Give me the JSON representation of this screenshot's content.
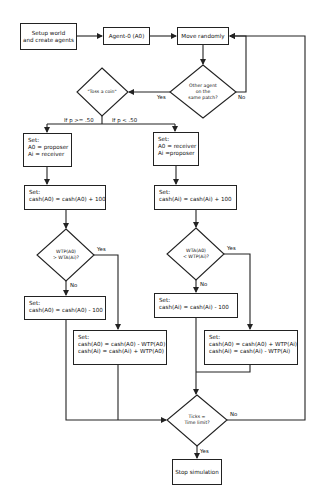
{
  "flowchart": {
    "nodes": {
      "setup": {
        "type": "process",
        "lines": [
          "Setup world",
          "and create agents"
        ]
      },
      "agent0": {
        "type": "process",
        "label": "Agent-0 (A0)"
      },
      "move": {
        "type": "process",
        "label": "Move randomly"
      },
      "other_agent": {
        "type": "decision",
        "lines": [
          "Other agent",
          "on the",
          "same patch?"
        ]
      },
      "toss": {
        "type": "decision",
        "label": "\"Toss a coin\""
      },
      "left_set_roles": {
        "type": "process",
        "lines": [
          "Set:",
          "A0 = proposer",
          "Ai = receiver"
        ]
      },
      "right_set_roles": {
        "type": "process",
        "lines": [
          "Set:",
          "A0 = receiver",
          "Ai =proposer"
        ]
      },
      "left_cash_plus": {
        "type": "process",
        "lines": [
          "Set:",
          "cash(A0) = cash(A0) + 100"
        ]
      },
      "right_cash_plus": {
        "type": "process",
        "lines": [
          "Set:",
          "cash(Ai) = cash(Ai) + 100"
        ]
      },
      "left_decision": {
        "type": "decision",
        "lines": [
          "WTP(A0)",
          "> WTA(Ai)?"
        ]
      },
      "right_decision": {
        "type": "decision",
        "lines": [
          "WTA(A0)",
          "< WTP(Ai)?"
        ]
      },
      "left_cash_minus": {
        "type": "process",
        "lines": [
          "Set:",
          "cash(A0) = cash(A0) - 100"
        ]
      },
      "right_cash_minus": {
        "type": "process",
        "lines": [
          "Set:",
          "cash(Ai) = cash(Ai) - 100"
        ]
      },
      "left_trade": {
        "type": "process",
        "lines": [
          "Set:",
          "cash(A0) = cash(A0) - WTP(A0)",
          "cash(Ai) = cash(Ai) + WTP(A0)"
        ]
      },
      "right_trade": {
        "type": "process",
        "lines": [
          "Set:",
          "cash(A0) = cash(A0) + WTP(Ai)",
          "cash(Ai) = cash(Ai) - WTP(Ai)"
        ]
      },
      "ticks": {
        "type": "decision",
        "lines": [
          "Ticks =",
          "Time limit?"
        ]
      },
      "stop": {
        "type": "process",
        "label": "Stop simulation"
      }
    },
    "edge_labels": {
      "other_yes": "Yes",
      "other_no": "No",
      "p_high": "If p >= .50",
      "p_low": "If p < .50",
      "left_yes": "Yes",
      "left_no": "No",
      "right_yes": "Yes",
      "right_no": "No",
      "ticks_no": "No",
      "ticks_yes": "Yes"
    },
    "style": {
      "stroke": "#222222",
      "background": "#ffffff"
    }
  }
}
